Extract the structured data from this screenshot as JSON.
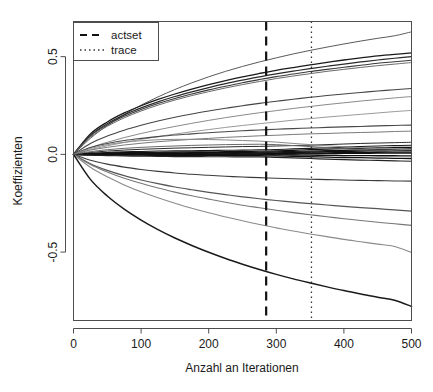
{
  "chart_data": {
    "type": "line",
    "title": "",
    "xlabel": "Anzahl an Iterationen",
    "ylabel": "Koeffizienten",
    "xlim": [
      0,
      500
    ],
    "ylim": [
      -0.85,
      0.68
    ],
    "xticks": [
      0,
      100,
      200,
      300,
      400,
      500
    ],
    "xtick_labels": [
      "0",
      "100",
      "200",
      "300",
      "400",
      "500"
    ],
    "yticks": [
      -0.5,
      0.0,
      0.5
    ],
    "ytick_labels": [
      "-0.5",
      "0.0",
      "0.5"
    ],
    "grid": false,
    "legend_position": "top-left",
    "legend": [
      {
        "label": "actset",
        "style": "dashed"
      },
      {
        "label": "trace",
        "style": "dotted"
      }
    ],
    "annotations": [
      {
        "name": "actset",
        "type": "vline",
        "x": 285,
        "style": "dashed",
        "color": "#111111",
        "width": 2.2
      },
      {
        "name": "trace",
        "type": "vline",
        "x": 352,
        "style": "dotted",
        "color": "#333333",
        "width": 1.3
      }
    ],
    "x": [
      0,
      25,
      50,
      75,
      100,
      125,
      150,
      175,
      200,
      225,
      250,
      275,
      300,
      325,
      350,
      375,
      400,
      425,
      450,
      475,
      500
    ],
    "series": [
      {
        "name": "coef_01",
        "color": "#5a5a5a",
        "width": 1.0,
        "values": [
          0.0,
          0.082,
          0.148,
          0.204,
          0.252,
          0.294,
          0.332,
          0.366,
          0.397,
          0.425,
          0.45,
          0.473,
          0.494,
          0.514,
          0.532,
          0.549,
          0.565,
          0.58,
          0.594,
          0.607,
          0.627
        ]
      },
      {
        "name": "coef_02",
        "color": "#1a1a1a",
        "width": 1.3,
        "values": [
          0.0,
          0.105,
          0.166,
          0.212,
          0.249,
          0.281,
          0.309,
          0.334,
          0.357,
          0.378,
          0.397,
          0.414,
          0.43,
          0.444,
          0.458,
          0.471,
          0.483,
          0.494,
          0.504,
          0.512,
          0.519
        ]
      },
      {
        "name": "coef_03",
        "color": "#2a2a2a",
        "width": 1.2,
        "values": [
          0.0,
          0.098,
          0.157,
          0.202,
          0.238,
          0.269,
          0.296,
          0.32,
          0.342,
          0.362,
          0.38,
          0.397,
          0.412,
          0.426,
          0.439,
          0.451,
          0.462,
          0.473,
          0.483,
          0.492,
          0.5
        ]
      },
      {
        "name": "coef_04",
        "color": "#3a3a3a",
        "width": 1.1,
        "values": [
          0.0,
          0.094,
          0.151,
          0.195,
          0.23,
          0.26,
          0.286,
          0.309,
          0.33,
          0.349,
          0.367,
          0.383,
          0.398,
          0.411,
          0.424,
          0.435,
          0.446,
          0.456,
          0.466,
          0.474,
          0.482
        ]
      },
      {
        "name": "coef_05",
        "color": "#6a6a6a",
        "width": 1.0,
        "values": [
          0.0,
          0.088,
          0.144,
          0.187,
          0.222,
          0.252,
          0.278,
          0.301,
          0.321,
          0.34,
          0.357,
          0.373,
          0.388,
          0.401,
          0.413,
          0.425,
          0.435,
          0.445,
          0.454,
          0.462,
          0.47
        ]
      },
      {
        "name": "coef_06",
        "color": "#444444",
        "width": 1.1,
        "values": [
          0.0,
          0.056,
          0.094,
          0.124,
          0.149,
          0.171,
          0.19,
          0.207,
          0.222,
          0.236,
          0.249,
          0.261,
          0.272,
          0.282,
          0.292,
          0.301,
          0.309,
          0.317,
          0.324,
          0.331,
          0.337
        ]
      },
      {
        "name": "coef_07",
        "color": "#8a8a8a",
        "width": 1.0,
        "values": [
          0.0,
          0.035,
          0.062,
          0.086,
          0.107,
          0.126,
          0.143,
          0.159,
          0.174,
          0.188,
          0.201,
          0.213,
          0.224,
          0.235,
          0.245,
          0.255,
          0.264,
          0.273,
          0.281,
          0.289,
          0.296
        ]
      },
      {
        "name": "coef_08",
        "color": "#9a9a9a",
        "width": 1.0,
        "values": [
          0.0,
          0.024,
          0.044,
          0.061,
          0.077,
          0.091,
          0.104,
          0.116,
          0.127,
          0.138,
          0.148,
          0.157,
          0.166,
          0.175,
          0.183,
          0.191,
          0.198,
          0.205,
          0.212,
          0.219,
          0.225
        ]
      },
      {
        "name": "coef_09",
        "color": "#4a4a4a",
        "width": 1.1,
        "values": [
          0.0,
          0.035,
          0.056,
          0.071,
          0.082,
          0.091,
          0.099,
          0.105,
          0.111,
          0.116,
          0.121,
          0.125,
          0.129,
          0.132,
          0.135,
          0.138,
          0.141,
          0.143,
          0.146,
          0.148,
          0.15
        ]
      },
      {
        "name": "coef_10",
        "color": "#7a7a7a",
        "width": 1.0,
        "values": [
          0.0,
          0.022,
          0.036,
          0.048,
          0.057,
          0.065,
          0.071,
          0.077,
          0.082,
          0.087,
          0.091,
          0.095,
          0.098,
          0.102,
          0.105,
          0.107,
          0.11,
          0.112,
          0.114,
          0.117,
          0.119
        ]
      },
      {
        "name": "coef_11",
        "color": "#2a2a2a",
        "width": 1.0,
        "values": [
          0.0,
          0.01,
          0.017,
          0.022,
          0.026,
          0.029,
          0.032,
          0.034,
          0.036,
          0.038,
          0.04,
          0.041,
          0.043,
          0.045,
          0.047,
          0.05,
          0.053,
          0.056,
          0.058,
          0.06,
          0.062
        ]
      },
      {
        "name": "coef_12",
        "color": "#1a1a1a",
        "width": 1.1,
        "values": [
          0.0,
          0.006,
          0.01,
          0.013,
          0.015,
          0.017,
          0.018,
          0.019,
          0.02,
          0.021,
          0.022,
          0.023,
          0.025,
          0.028,
          0.031,
          0.034,
          0.037,
          0.04,
          0.043,
          0.045,
          0.047
        ]
      },
      {
        "name": "coef_13",
        "color": "#111111",
        "width": 1.2,
        "values": [
          0.0,
          0.004,
          0.007,
          0.009,
          0.01,
          0.011,
          0.012,
          0.013,
          0.013,
          0.014,
          0.015,
          0.016,
          0.018,
          0.021,
          0.024,
          0.027,
          0.029,
          0.031,
          0.033,
          0.035,
          0.036
        ]
      },
      {
        "name": "coef_14",
        "color": "#111111",
        "width": 1.2,
        "values": [
          0.0,
          0.003,
          0.005,
          0.006,
          0.007,
          0.008,
          0.008,
          0.009,
          0.009,
          0.01,
          0.01,
          0.011,
          0.013,
          0.015,
          0.017,
          0.019,
          0.021,
          0.023,
          0.025,
          0.026,
          0.028
        ]
      },
      {
        "name": "coef_15",
        "color": "#111111",
        "width": 1.3,
        "values": [
          0.0,
          0.002,
          0.003,
          0.004,
          0.004,
          0.005,
          0.005,
          0.005,
          0.006,
          0.006,
          0.006,
          0.007,
          0.008,
          0.01,
          0.012,
          0.014,
          0.015,
          0.017,
          0.018,
          0.019,
          0.02
        ]
      },
      {
        "name": "coef_16",
        "color": "#111111",
        "width": 1.3,
        "values": [
          0.0,
          0.001,
          0.002,
          0.002,
          0.002,
          0.002,
          0.003,
          0.003,
          0.003,
          0.003,
          0.003,
          0.003,
          0.004,
          0.005,
          0.007,
          0.008,
          0.009,
          0.01,
          0.011,
          0.012,
          0.012
        ]
      },
      {
        "name": "coef_17",
        "color": "#111111",
        "width": 1.3,
        "values": [
          0.0,
          0.0,
          0.0,
          0.0,
          0.0,
          0.0,
          0.0,
          0.0,
          0.0,
          0.0,
          0.0,
          0.0,
          0.001,
          0.002,
          0.003,
          0.004,
          0.005,
          0.005,
          0.006,
          0.006,
          0.006
        ]
      },
      {
        "name": "coef_18",
        "color": "#111111",
        "width": 1.3,
        "values": [
          0.0,
          -0.001,
          -0.001,
          -0.001,
          -0.001,
          -0.001,
          -0.001,
          -0.001,
          -0.001,
          -0.001,
          -0.001,
          -0.001,
          -0.002,
          -0.003,
          -0.004,
          -0.005,
          -0.006,
          -0.006,
          -0.007,
          -0.007,
          -0.008
        ]
      },
      {
        "name": "coef_19",
        "color": "#111111",
        "width": 1.3,
        "values": [
          0.0,
          -0.002,
          -0.003,
          -0.004,
          -0.004,
          -0.005,
          -0.005,
          -0.005,
          -0.005,
          -0.006,
          -0.006,
          -0.006,
          -0.008,
          -0.01,
          -0.012,
          -0.014,
          -0.016,
          -0.017,
          -0.019,
          -0.02,
          -0.021
        ]
      },
      {
        "name": "coef_20",
        "color": "#222222",
        "width": 1.2,
        "values": [
          0.0,
          -0.004,
          -0.006,
          -0.008,
          -0.009,
          -0.01,
          -0.011,
          -0.011,
          -0.012,
          -0.012,
          -0.013,
          -0.013,
          -0.015,
          -0.018,
          -0.021,
          -0.024,
          -0.027,
          -0.029,
          -0.031,
          -0.033,
          -0.035
        ]
      },
      {
        "name": "coef_21",
        "color": "#6a6a6a",
        "width": 1.0,
        "values": [
          0.0,
          0.014,
          0.024,
          0.031,
          0.036,
          0.04,
          0.043,
          0.046,
          0.048,
          0.05,
          0.051,
          0.052,
          0.05,
          0.045,
          0.04,
          0.035,
          0.03,
          0.026,
          0.022,
          0.019,
          0.016
        ]
      },
      {
        "name": "coef_22",
        "color": "#8a8a8a",
        "width": 1.0,
        "values": [
          0.0,
          0.03,
          0.05,
          0.062,
          0.07,
          0.075,
          0.077,
          0.077,
          0.076,
          0.074,
          0.071,
          0.068,
          0.063,
          0.056,
          0.05,
          0.044,
          0.039,
          0.034,
          0.03,
          0.027,
          0.024
        ]
      },
      {
        "name": "coef_23",
        "color": "#3a3a3a",
        "width": 1.1,
        "values": [
          0.0,
          -0.03,
          -0.05,
          -0.065,
          -0.077,
          -0.087,
          -0.095,
          -0.102,
          -0.107,
          -0.112,
          -0.116,
          -0.119,
          -0.122,
          -0.125,
          -0.127,
          -0.129,
          -0.131,
          -0.133,
          -0.134,
          -0.136,
          -0.137
        ]
      },
      {
        "name": "coef_24",
        "color": "#555555",
        "width": 1.2,
        "values": [
          0.0,
          -0.048,
          -0.082,
          -0.109,
          -0.131,
          -0.15,
          -0.167,
          -0.181,
          -0.194,
          -0.206,
          -0.217,
          -0.227,
          -0.236,
          -0.244,
          -0.252,
          -0.259,
          -0.266,
          -0.272,
          -0.278,
          -0.284,
          -0.29
        ]
      },
      {
        "name": "coef_25",
        "color": "#777777",
        "width": 1.1,
        "values": [
          0.0,
          -0.052,
          -0.09,
          -0.122,
          -0.148,
          -0.172,
          -0.193,
          -0.212,
          -0.229,
          -0.245,
          -0.26,
          -0.273,
          -0.286,
          -0.298,
          -0.309,
          -0.319,
          -0.329,
          -0.338,
          -0.347,
          -0.355,
          -0.363
        ]
      },
      {
        "name": "coef_26",
        "color": "#8a8a8a",
        "width": 1.1,
        "values": [
          0.0,
          -0.066,
          -0.115,
          -0.156,
          -0.191,
          -0.222,
          -0.25,
          -0.276,
          -0.299,
          -0.32,
          -0.34,
          -0.359,
          -0.376,
          -0.392,
          -0.407,
          -0.421,
          -0.435,
          -0.447,
          -0.459,
          -0.471,
          -0.502
        ]
      },
      {
        "name": "coef_27",
        "color": "#1a1a1a",
        "width": 1.5,
        "values": [
          0.0,
          -0.128,
          -0.213,
          -0.28,
          -0.336,
          -0.385,
          -0.428,
          -0.466,
          -0.501,
          -0.533,
          -0.562,
          -0.589,
          -0.614,
          -0.637,
          -0.658,
          -0.678,
          -0.697,
          -0.714,
          -0.731,
          -0.746,
          -0.778
        ]
      }
    ]
  },
  "axes": {
    "ylabel": "Koeffizienten",
    "xlabel": "Anzahl an Iterationen"
  }
}
